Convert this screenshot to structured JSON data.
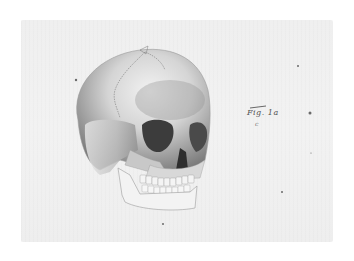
{
  "image": {
    "subject": "anatomical drawing of a human skull, three-quarter front view",
    "caption": "Fig. 1a",
    "caption_sub": "c",
    "colors": {
      "paper": "#f0f0f0",
      "border": "#ffffff",
      "bone_light": "#e6e6e6",
      "bone_shadow": "#8a8a8a",
      "orbit_dark": "#3c3c3c",
      "ink": "#555555"
    }
  }
}
